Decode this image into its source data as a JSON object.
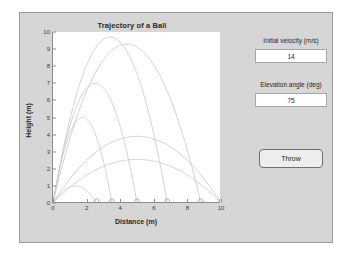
{
  "window": {
    "background": "#d6d6d6",
    "border_color": "#9a9a9a"
  },
  "controls": {
    "velocity_label": "Initial velocity (m/s)",
    "velocity_value": "14",
    "angle_label": "Elevation angle (deg)",
    "angle_value": "75",
    "throw_label": "Throw"
  },
  "chart_data": {
    "type": "line",
    "title": "Trajectory of a Ball",
    "xlabel": "Distance (m)",
    "ylabel": "Height (m)",
    "xlim": [
      0,
      10
    ],
    "ylim": [
      0,
      10
    ],
    "xticks": [
      0,
      2,
      4,
      6,
      8,
      10
    ],
    "yticks": [
      0,
      1,
      2,
      3,
      4,
      5,
      6,
      7,
      8,
      9,
      10
    ],
    "grid": false,
    "legend": "none",
    "line_color": "#c8c8c8",
    "marker": "circle-open",
    "series": [
      {
        "name": "throw-1",
        "angle_deg": 75,
        "range_m": 2.6,
        "peak_height_m": 1.0,
        "x": [
          0,
          0.33,
          0.65,
          0.98,
          1.3,
          1.63,
          1.95,
          2.28,
          2.6
        ],
        "y": [
          0,
          0.44,
          0.75,
          0.94,
          1.0,
          0.94,
          0.75,
          0.44,
          0
        ]
      },
      {
        "name": "throw-2",
        "angle_deg": 75,
        "range_m": 3.5,
        "peak_height_m": 5.0,
        "x": [
          0,
          0.44,
          0.88,
          1.31,
          1.75,
          2.19,
          2.63,
          3.06,
          3.5
        ],
        "y": [
          0,
          2.19,
          3.75,
          4.69,
          5.0,
          4.69,
          3.75,
          2.19,
          0
        ]
      },
      {
        "name": "throw-3",
        "angle_deg": 70,
        "range_m": 5.0,
        "peak_height_m": 7.0,
        "x": [
          0,
          0.63,
          1.25,
          1.88,
          2.5,
          3.13,
          3.75,
          4.38,
          5.0
        ],
        "y": [
          0,
          3.06,
          5.25,
          6.56,
          7.0,
          6.56,
          5.25,
          3.06,
          0
        ]
      },
      {
        "name": "throw-4",
        "angle_deg": 60,
        "range_m": 6.8,
        "peak_height_m": 9.7,
        "x": [
          0,
          0.85,
          1.7,
          2.55,
          3.4,
          4.25,
          5.1,
          5.95,
          6.8
        ],
        "y": [
          0,
          4.24,
          7.28,
          9.09,
          9.7,
          9.09,
          7.28,
          4.24,
          0
        ]
      },
      {
        "name": "throw-5",
        "angle_deg": 50,
        "range_m": 8.8,
        "peak_height_m": 9.3,
        "x": [
          0,
          1.1,
          2.2,
          3.3,
          4.4,
          5.5,
          6.6,
          7.7,
          8.8
        ],
        "y": [
          0,
          4.07,
          6.98,
          8.71,
          9.3,
          8.71,
          6.98,
          4.07,
          0
        ]
      },
      {
        "name": "throw-6",
        "angle_deg": 40,
        "range_m": 10.0,
        "peak_height_m": 3.9,
        "x": [
          0,
          1.25,
          2.5,
          3.75,
          5.0,
          6.25,
          7.5,
          8.75,
          10.0
        ],
        "y": [
          0,
          1.71,
          2.93,
          3.66,
          3.9,
          3.66,
          2.93,
          1.71,
          0
        ]
      },
      {
        "name": "throw-7",
        "angle_deg": 30,
        "range_m": 10.0,
        "peak_height_m": 2.55,
        "x": [
          0,
          1.25,
          2.5,
          3.75,
          5.0,
          6.25,
          7.5,
          8.75,
          10.0
        ],
        "y": [
          0,
          1.12,
          1.91,
          2.39,
          2.55,
          2.39,
          1.91,
          1.12,
          0
        ]
      }
    ],
    "landing_markers": [
      {
        "x": 2.6,
        "y": 0
      },
      {
        "x": 3.5,
        "y": 0
      },
      {
        "x": 5.0,
        "y": 0
      },
      {
        "x": 6.8,
        "y": 0
      },
      {
        "x": 8.8,
        "y": 0
      },
      {
        "x": 10.0,
        "y": 0
      }
    ]
  }
}
